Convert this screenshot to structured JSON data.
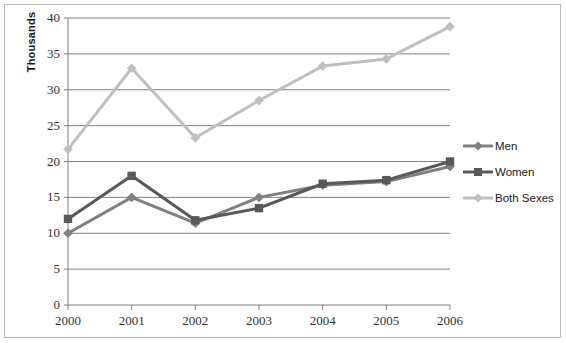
{
  "chart_data": {
    "type": "line",
    "title": "",
    "xlabel": "",
    "ylabel": "Thousands",
    "categories": [
      "2000",
      "2001",
      "2002",
      "2003",
      "2004",
      "2005",
      "2006"
    ],
    "ylim": [
      0,
      40
    ],
    "yticks": [
      "0",
      "5",
      "10",
      "15",
      "20",
      "25",
      "30",
      "35",
      "40"
    ],
    "grid": true,
    "legend_position": "right",
    "series": [
      {
        "name": "Men",
        "color": "#808080",
        "marker": "diamond",
        "values": [
          10.0,
          15.0,
          11.4,
          15.0,
          16.7,
          17.2,
          19.3
        ]
      },
      {
        "name": "Women",
        "color": "#595959",
        "marker": "square",
        "values": [
          12.0,
          18.0,
          11.8,
          13.5,
          16.9,
          17.4,
          20.0
        ]
      },
      {
        "name": "Both Sexes",
        "color": "#bfbfbf",
        "marker": "diamond",
        "values": [
          21.7,
          33.0,
          23.3,
          28.5,
          33.3,
          34.3,
          38.8
        ]
      }
    ]
  },
  "axis": {
    "line_color": "#808080",
    "grid_color": "#808080"
  }
}
